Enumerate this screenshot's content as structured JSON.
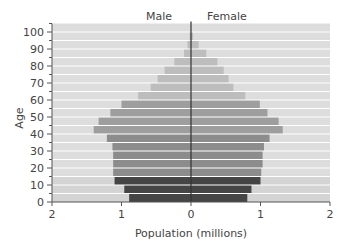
{
  "chart_data": {
    "type": "bar",
    "subtype": "population-pyramid",
    "title": "",
    "xlabel": "Population (millions)",
    "ylabel": "Age",
    "legend": {
      "left_label": "Male",
      "right_label": "Female",
      "position": "top"
    },
    "xlim": [
      -2,
      2
    ],
    "x_ticks": [
      -2,
      -1,
      0,
      1,
      2
    ],
    "x_tick_labels": [
      "2",
      "1",
      "0",
      "1",
      "2"
    ],
    "ylim": [
      0,
      105
    ],
    "y_ticks": [
      0,
      10,
      20,
      30,
      40,
      50,
      60,
      70,
      80,
      90,
      100
    ],
    "y_tick_labels": [
      "0",
      "10",
      "20",
      "30",
      "40",
      "50",
      "60",
      "70",
      "80",
      "90",
      "100"
    ],
    "y_minor_ticks_every": 5,
    "grid": false,
    "categories": [
      "0-4",
      "5-9",
      "10-14",
      "15-19",
      "20-24",
      "25-29",
      "30-34",
      "35-39",
      "40-44",
      "45-49",
      "50-54",
      "55-59",
      "60-64",
      "65-69",
      "70-74",
      "75-79",
      "80-84",
      "85-89",
      "90-94",
      "95-99"
    ],
    "series": [
      {
        "name": "Male",
        "values": [
          0.89,
          0.96,
          1.1,
          1.12,
          1.12,
          1.12,
          1.13,
          1.21,
          1.4,
          1.33,
          1.16,
          1.0,
          0.76,
          0.58,
          0.48,
          0.38,
          0.24,
          0.1,
          0.05,
          0.02
        ]
      },
      {
        "name": "Female",
        "values": [
          0.81,
          0.87,
          1.0,
          1.01,
          1.03,
          1.03,
          1.05,
          1.13,
          1.32,
          1.26,
          1.1,
          0.99,
          0.78,
          0.61,
          0.54,
          0.47,
          0.38,
          0.22,
          0.11,
          0.03
        ]
      }
    ],
    "band_colors": {
      "0-14": "#454545",
      "15-39": "#8c8c8c",
      "40-59": "#9e9e9e",
      "60+": "#bdbdbd"
    },
    "background_band_color": "#dddddd",
    "separator_color": "#ffffff",
    "center_line_color": "#333333"
  }
}
